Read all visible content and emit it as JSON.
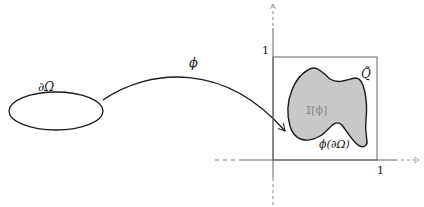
{
  "diagram": {
    "domain_boundary_label": "∂Ω",
    "map_label": "ϕ",
    "image_set_label": "𝕀[ϕ]",
    "image_boundary_label": "ϕ(∂Ω)",
    "box_label": "Q̃",
    "y_tick_label": "1",
    "x_tick_label": "1",
    "colors": {
      "stroke": "#1a1a1a",
      "fill": "#c8c8c8",
      "axis": "#666666",
      "faint_label": "#8a8a8a"
    }
  }
}
